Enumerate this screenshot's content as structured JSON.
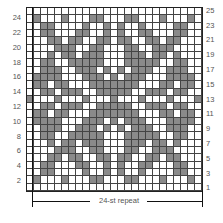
{
  "chart": {
    "title": "",
    "columns": 25,
    "rows": 25,
    "repeat_label": "24-st repeat",
    "colors": {
      "dark": "#8a8a8a",
      "light": "#ffffff",
      "grid": "#444444"
    },
    "left_row_labels": [
      "24",
      "22",
      "20",
      "18",
      "16",
      "14",
      "12",
      "10",
      "8",
      "6",
      "4",
      "2"
    ],
    "right_row_labels": [
      "25",
      "23",
      "21",
      "19",
      "17",
      "15",
      "13",
      "11",
      "9",
      "7",
      "5",
      "3",
      "1"
    ],
    "half_pattern_note": "dark cells per row for cols 1-13; mirrored horizontally around col 13 and vertically around row 13",
    "top_half_rows": {
      "25": [],
      "24": [
        2,
        6,
        10,
        11
      ],
      "23": [
        3,
        4,
        9,
        12
      ],
      "22": [
        3,
        4,
        8,
        9,
        12
      ],
      "21": [
        4,
        5,
        7,
        8,
        11,
        12
      ],
      "20": [
        5,
        6,
        7,
        10,
        11
      ],
      "19": [
        4,
        6,
        7,
        9,
        10,
        11
      ],
      "18": [
        3,
        4,
        7,
        8,
        9,
        10,
        11
      ],
      "17": [
        3,
        4,
        5,
        8,
        9,
        10,
        12
      ],
      "16": [
        2,
        3,
        4,
        5,
        9,
        10,
        11,
        13
      ],
      "15": [
        2,
        3,
        5,
        6,
        10,
        11,
        12,
        13
      ],
      "14": [
        3,
        4,
        6,
        7,
        8,
        11,
        12,
        13
      ],
      "13": [
        1,
        5,
        9,
        13
      ]
    }
  },
  "chart_data": {
    "type": "table",
    "xlabel": "24-st repeat",
    "ylabel": "",
    "grid": true,
    "dimensions": {
      "columns": 25,
      "rows": 25
    },
    "row_labels_left": [
      24,
      22,
      20,
      18,
      16,
      14,
      12,
      10,
      8,
      6,
      4,
      2
    ],
    "row_labels_right": [
      25,
      23,
      21,
      19,
      17,
      15,
      13,
      11,
      9,
      7,
      5,
      3,
      1
    ],
    "symmetry": "horizontal mirror about column 13, vertical mirror about row 13"
  }
}
